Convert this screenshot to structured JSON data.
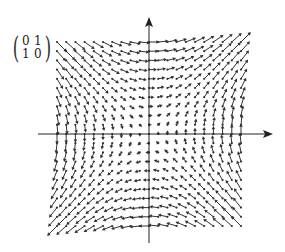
{
  "matrix": {
    "rows": [
      [
        "0",
        "1"
      ],
      [
        "1",
        "0"
      ]
    ]
  },
  "field": {
    "description": "Vector field v(x, y) = A·(x, y) = (y, x)",
    "matrix_numeric": [
      [
        0,
        1
      ],
      [
        1,
        0
      ]
    ],
    "x_range": [
      -1,
      1
    ],
    "y_range": [
      -1,
      1
    ],
    "grid_points_per_axis": 21,
    "arrow_color": "#333333",
    "axis_color": "#222222"
  },
  "axes": {
    "x_axis_arrow": true,
    "y_axis_arrow": true
  }
}
